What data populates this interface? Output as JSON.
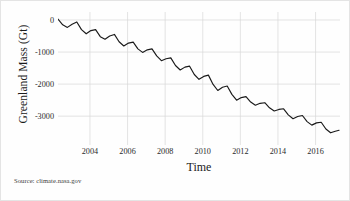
{
  "chart_data": {
    "type": "line",
    "title": "",
    "xlabel": "Time",
    "ylabel": "Greenland Mass (Gt)",
    "xlim": [
      2002.3,
      2017.3
    ],
    "ylim": [
      -3900,
      250
    ],
    "xticks": [
      2004,
      2006,
      2008,
      2010,
      2012,
      2014,
      2016
    ],
    "xticklabels": [
      "2004",
      "2006",
      "2008",
      "2010",
      "2012",
      "2014",
      "2016"
    ],
    "yticks": [
      0,
      -1000,
      -2000,
      -3000
    ],
    "yticklabels": [
      "0",
      "-1000",
      "-2000",
      "-3000"
    ],
    "grid": true,
    "legend": null,
    "line_color": "#1a1a1a",
    "grid_color": "#d8d8d8",
    "source_note": "Source: climate.nasa.gov",
    "series": [
      {
        "name": "Greenland ice mass anomaly",
        "x": [
          2002.3,
          2002.55,
          2002.8,
          2003.05,
          2003.3,
          2003.55,
          2003.8,
          2004.05,
          2004.3,
          2004.55,
          2004.8,
          2005.05,
          2005.3,
          2005.55,
          2005.8,
          2006.05,
          2006.3,
          2006.55,
          2006.8,
          2007.05,
          2007.3,
          2007.55,
          2007.8,
          2008.05,
          2008.3,
          2008.55,
          2008.8,
          2009.05,
          2009.3,
          2009.55,
          2009.8,
          2010.05,
          2010.3,
          2010.55,
          2010.8,
          2011.05,
          2011.3,
          2011.55,
          2011.8,
          2012.05,
          2012.3,
          2012.55,
          2012.8,
          2013.05,
          2013.3,
          2013.55,
          2013.8,
          2014.05,
          2014.3,
          2014.55,
          2014.8,
          2015.05,
          2015.3,
          2015.55,
          2015.8,
          2016.05,
          2016.3,
          2016.55,
          2016.8,
          2017.05,
          2017.25
        ],
        "y": [
          30,
          -150,
          -230,
          -130,
          -60,
          -300,
          -430,
          -330,
          -300,
          -520,
          -600,
          -500,
          -450,
          -680,
          -810,
          -720,
          -690,
          -900,
          -1010,
          -930,
          -900,
          -1120,
          -1270,
          -1210,
          -1180,
          -1420,
          -1560,
          -1470,
          -1440,
          -1700,
          -1850,
          -1760,
          -1720,
          -2010,
          -2200,
          -2100,
          -2060,
          -2320,
          -2500,
          -2420,
          -2390,
          -2560,
          -2660,
          -2600,
          -2580,
          -2740,
          -2840,
          -2790,
          -2770,
          -2960,
          -3080,
          -3010,
          -2980,
          -3170,
          -3280,
          -3210,
          -3190,
          -3400,
          -3520,
          -3470,
          -3440
        ]
      }
    ]
  }
}
